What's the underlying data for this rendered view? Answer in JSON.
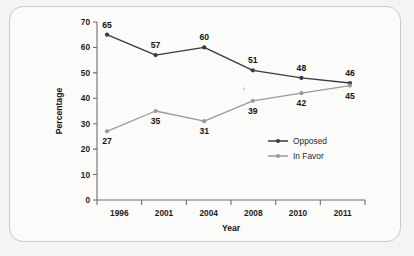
{
  "chart_data": {
    "type": "line",
    "title": "",
    "xlabel": "Year",
    "ylabel": "Percentage",
    "categories": [
      "1996",
      "2001",
      "2004",
      "2008",
      "2010",
      "2011"
    ],
    "series": [
      {
        "name": "Opposed",
        "color": "#3b3b3b",
        "values": [
          65,
          57,
          60,
          51,
          48,
          46
        ],
        "label_positions": [
          "above",
          "above",
          "above",
          "above",
          "above",
          "above"
        ]
      },
      {
        "name": "In Favor",
        "color": "#9a9a9a",
        "values": [
          27,
          35,
          31,
          39,
          42,
          45
        ],
        "label_positions": [
          "below",
          "below",
          "below",
          "below",
          "below",
          "below"
        ]
      }
    ],
    "ylim": [
      0,
      70
    ],
    "yticks": [
      "0",
      "10",
      "20",
      "30",
      "40",
      "50",
      "60",
      "70"
    ],
    "xlim_categories": 6,
    "grid": false,
    "legend_position": "center-right"
  },
  "legend": {
    "entries": [
      {
        "label": "Opposed",
        "color": "#3b3b3b"
      },
      {
        "label": "In Favor",
        "color": "#9a9a9a"
      }
    ]
  },
  "colors": {
    "opposed": "#3b3b3b",
    "in_favor": "#9a9a9a",
    "axis": "#6e6e6e",
    "panel_background": "#fbfbfa",
    "page_background": "#f4f4f2",
    "panel_border": "#c9c9c9"
  }
}
